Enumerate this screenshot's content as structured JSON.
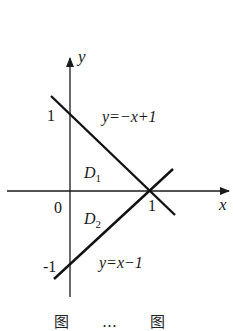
{
  "figure": {
    "axes": {
      "x_label": "x",
      "y_label": "y",
      "origin_label": "0",
      "x_tick_labels": [
        "1"
      ],
      "y_tick_labels": [
        "1",
        "-1"
      ]
    },
    "lines": [
      {
        "equation": "y=−x+1",
        "label_text": "y=−x+1",
        "points": [
          [
            0,
            1
          ],
          [
            1,
            0
          ]
        ]
      },
      {
        "equation": "y=x−1",
        "label_text": "y=x−1",
        "points": [
          [
            0,
            -1
          ],
          [
            1,
            0
          ]
        ]
      }
    ],
    "regions": [
      {
        "name": "D",
        "subscript": "1"
      },
      {
        "name": "D",
        "subscript": "2"
      }
    ],
    "caption_partial": "图 … 图"
  },
  "colors": {
    "ink": "#1a1a1a",
    "background": "#ffffff"
  }
}
